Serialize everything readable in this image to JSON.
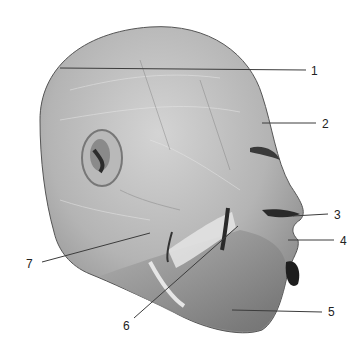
{
  "figure": {
    "background": "#ffffff",
    "tissue_light": "#c9c9c9",
    "tissue_mid": "#9e9e9e",
    "tissue_dark": "#3a3a3a",
    "line_color": "#3c3c3c"
  },
  "labels": [
    {
      "id": "1",
      "text": "1",
      "x": 311,
      "y": 65,
      "line": [
        60,
        68,
        306,
        70
      ]
    },
    {
      "id": "2",
      "text": "2",
      "x": 322,
      "y": 121,
      "line": [
        262,
        123,
        316,
        123
      ]
    },
    {
      "id": "3",
      "text": "3",
      "x": 334,
      "y": 209,
      "line": [
        293,
        216,
        328,
        214
      ]
    },
    {
      "id": "4",
      "text": "4",
      "x": 340,
      "y": 235,
      "line": [
        288,
        240,
        334,
        240
      ]
    },
    {
      "id": "5",
      "text": "5",
      "x": 330,
      "y": 306,
      "line": [
        232,
        310,
        322,
        312
      ]
    },
    {
      "id": "6",
      "text": "6",
      "x": 123,
      "y": 322,
      "line": [
        134,
        318,
        238,
        226
      ]
    },
    {
      "id": "7",
      "text": "7",
      "x": 27,
      "y": 260,
      "line": [
        42,
        262,
        150,
        233
      ]
    }
  ]
}
